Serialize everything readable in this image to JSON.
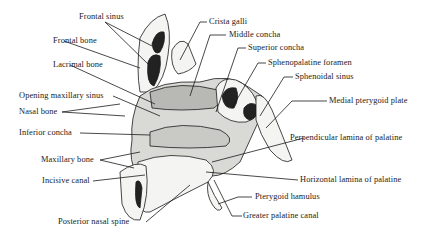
{
  "figure": {
    "labels_left": [
      {
        "id": "frontal-sinus",
        "text": "Frontal sinus"
      },
      {
        "id": "frontal-bone",
        "text": "Frontal bone"
      },
      {
        "id": "lacrimal-bone",
        "text": "Lacrimal bone"
      },
      {
        "id": "opening-maxillary-sinus",
        "text": "Opening maxillary  sinus"
      },
      {
        "id": "nasal-bone",
        "text": "Nasal bone"
      },
      {
        "id": "inferior-concha",
        "text": "Inferior concha"
      },
      {
        "id": "maxillary-bone",
        "text": "Maxillary bone"
      },
      {
        "id": "incisive-canal",
        "text": "Incisive canal"
      },
      {
        "id": "posterior-nasal-spine",
        "text": "Posterior nasal spine"
      }
    ],
    "labels_right": [
      {
        "id": "crista-galli",
        "text": "Crista galli"
      },
      {
        "id": "middle-concha",
        "text": "Middle concha"
      },
      {
        "id": "superior-concha",
        "text": "Superior concha"
      },
      {
        "id": "sphenopalatine-foramen",
        "text": "Sphenopalatine foramen"
      },
      {
        "id": "sphenoidal-sinus",
        "text": "Sphenoidal sinus"
      },
      {
        "id": "medial-pterygoid-plate",
        "text": "Medial pterygoid plate"
      },
      {
        "id": "perpendicular-lamina",
        "text": "Perpendicular lamina of palatine"
      },
      {
        "id": "horizontal-lamina",
        "text": "Horizontal lamina of palatine"
      },
      {
        "id": "pterygoid-hamulus",
        "text": "Pterygoid hamulus"
      },
      {
        "id": "greater-palatine-canal",
        "text": "Greater palatine canal"
      }
    ],
    "colors": {
      "ink": "#1a1a1a",
      "background": "#ffffff",
      "bone_fill": "#f4f4f2",
      "shade": "#8a8a8a",
      "dark": "#222222"
    }
  }
}
